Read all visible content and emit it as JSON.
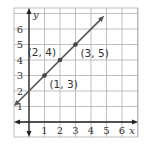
{
  "chart_data": {
    "type": "line",
    "title": "",
    "xlabel": "x",
    "ylabel": "y",
    "xlim": [
      -1,
      7
    ],
    "ylim": [
      -1,
      7
    ],
    "grid": true,
    "x_ticks": [
      "1",
      "2",
      "3",
      "4",
      "5",
      "6"
    ],
    "y_ticks": [
      "1",
      "2",
      "3",
      "4",
      "5",
      "6"
    ],
    "series": [
      {
        "name": "line",
        "equation": "y = x + 2",
        "x": [
          1,
          2,
          3
        ],
        "y": [
          3,
          4,
          5
        ]
      }
    ],
    "points": [
      {
        "x": 1,
        "y": 3,
        "label": "(1, 3)"
      },
      {
        "x": 2,
        "y": 4,
        "label": "(2, 4)"
      },
      {
        "x": 3,
        "y": 5,
        "label": "(3, 5)"
      }
    ],
    "colors": {
      "line": "#555555",
      "grid": "#b0b0b0",
      "axis": "#222222",
      "text": "#333333"
    }
  }
}
